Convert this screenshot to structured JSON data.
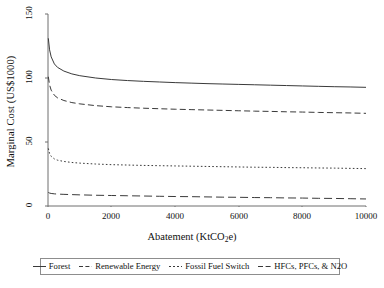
{
  "chart_data": {
    "type": "line",
    "title": "",
    "xlabel": "Abatement (KtCO2e)",
    "ylabel": "Marginal Cost (US$1000)",
    "xlabel_parts": {
      "pre": "Abatement (KtCO",
      "sub": "2",
      "post": "e)"
    },
    "xlim": [
      0,
      10000
    ],
    "ylim": [
      0,
      150
    ],
    "xticks": [
      0,
      2000,
      4000,
      6000,
      8000,
      10000
    ],
    "xtick_labels": [
      "0",
      "2000",
      "4000",
      "6000",
      "8000",
      "10000"
    ],
    "yticks": [
      0,
      50,
      100,
      150
    ],
    "ytick_labels": [
      "0",
      "50",
      "100",
      "150"
    ],
    "grid": false,
    "legend_position": "below-plot",
    "x": [
      10,
      50,
      100,
      200,
      300,
      500,
      750,
      1000,
      1500,
      2000,
      2500,
      3000,
      3500,
      4000,
      4500,
      5000,
      5500,
      6000,
      6500,
      7000,
      7500,
      8000,
      8500,
      9000,
      9500,
      10000
    ],
    "series": [
      {
        "name": "Forest",
        "style": "solid",
        "color": "#3a3a3a",
        "values": [
          131.0,
          122.0,
          116.5,
          111.0,
          108.3,
          105.4,
          103.2,
          101.8,
          100.0,
          98.8,
          98.0,
          97.4,
          96.9,
          96.4,
          96.0,
          95.6,
          95.3,
          95.0,
          94.7,
          94.4,
          94.1,
          93.8,
          93.5,
          93.2,
          93.0,
          92.7
        ]
      },
      {
        "name": "Renewable Energy",
        "style": "dashed",
        "color": "#3a3a3a",
        "values": [
          101.0,
          94.5,
          90.5,
          86.5,
          84.5,
          82.4,
          80.8,
          79.8,
          78.4,
          77.5,
          76.9,
          76.4,
          76.0,
          75.6,
          75.3,
          75.0,
          74.7,
          74.4,
          74.1,
          73.9,
          73.6,
          73.4,
          73.1,
          72.9,
          72.7,
          72.4
        ]
      },
      {
        "name": "Fossil Fuel Switch",
        "style": "dotted",
        "color": "#3a3a3a",
        "values": [
          45.0,
          41.0,
          38.8,
          36.8,
          35.8,
          34.8,
          34.0,
          33.5,
          32.8,
          32.3,
          32.0,
          31.7,
          31.5,
          31.3,
          31.1,
          30.9,
          30.7,
          30.5,
          30.3,
          30.2,
          30.0,
          29.9,
          29.7,
          29.6,
          29.4,
          29.2
        ]
      },
      {
        "name": "HFCs, PFCs, & N2O",
        "style": "longdash",
        "color": "#3a3a3a",
        "values": [
          10.6,
          10.1,
          9.8,
          9.5,
          9.3,
          9.1,
          8.9,
          8.7,
          8.4,
          8.2,
          8.0,
          7.8,
          7.6,
          7.4,
          7.3,
          7.1,
          6.9,
          6.8,
          6.6,
          6.5,
          6.3,
          6.2,
          6.0,
          5.9,
          5.7,
          5.5
        ]
      }
    ],
    "legend": [
      {
        "label": "Forest",
        "style": "solid"
      },
      {
        "label": "Renewable Energy",
        "style": "dashed"
      },
      {
        "label": "Fossil Fuel Switch",
        "style": "dotted"
      },
      {
        "label": "HFCs, PFCs, & N2O",
        "style": "longdash"
      }
    ]
  }
}
